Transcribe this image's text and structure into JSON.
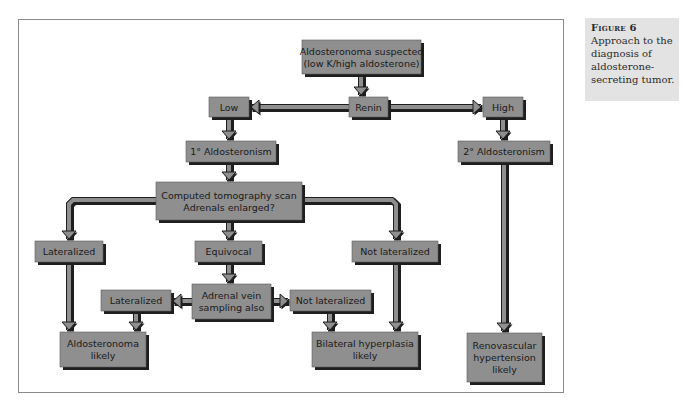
{
  "figure": {
    "label": "Figure 6",
    "caption": "Approach to the diagnosis of aldosterone-secreting tumor."
  },
  "colors": {
    "box_fill": "#8f8f8f",
    "box_shadow": "#1e1e1e",
    "arrow_fill": "#8f8f8f",
    "arrow_outline": "#1e1e1e",
    "frame_border": "#8a8a8a",
    "caption_bg": "#e3e3e3"
  },
  "nodes": {
    "start": {
      "lines": [
        "Aldosteronoma suspected",
        "(low K/high aldosterone)"
      ]
    },
    "renin": {
      "lines": [
        "Renin"
      ]
    },
    "low": {
      "lines": [
        "Low"
      ]
    },
    "high": {
      "lines": [
        "High"
      ]
    },
    "primary": {
      "lines": [
        "1° Aldosteronism"
      ]
    },
    "secondary": {
      "lines": [
        "2° Aldosteronism"
      ]
    },
    "ct_scan": {
      "lines": [
        "Computed tomography scan",
        "Adrenals enlarged?"
      ]
    },
    "ct_lateralized": {
      "lines": [
        "Lateralized"
      ]
    },
    "ct_equivocal": {
      "lines": [
        "Equivocal"
      ]
    },
    "ct_not_lateralized": {
      "lines": [
        "Not lateralized"
      ]
    },
    "avs": {
      "lines": [
        "Adrenal vein",
        "sampling also"
      ]
    },
    "avs_lateralized": {
      "lines": [
        "Lateralized"
      ]
    },
    "avs_not_lateralized": {
      "lines": [
        "Not lateralized"
      ]
    },
    "aldosteronoma": {
      "lines": [
        "Aldosteronoma",
        "likely"
      ]
    },
    "bilateral": {
      "lines": [
        "Bilateral hyperplasia",
        "likely"
      ]
    },
    "renovascular": {
      "lines": [
        "Renovascular",
        "hypertension",
        "likely"
      ]
    }
  },
  "edges": [
    [
      "start",
      "renin"
    ],
    [
      "renin",
      "low"
    ],
    [
      "renin",
      "high"
    ],
    [
      "low",
      "primary"
    ],
    [
      "high",
      "secondary"
    ],
    [
      "primary",
      "ct_scan"
    ],
    [
      "ct_scan",
      "ct_lateralized"
    ],
    [
      "ct_scan",
      "ct_equivocal"
    ],
    [
      "ct_scan",
      "ct_not_lateralized"
    ],
    [
      "ct_equivocal",
      "avs"
    ],
    [
      "avs",
      "avs_lateralized"
    ],
    [
      "avs",
      "avs_not_lateralized"
    ],
    [
      "ct_lateralized",
      "aldosteronoma"
    ],
    [
      "avs_lateralized",
      "aldosteronoma"
    ],
    [
      "ct_not_lateralized",
      "bilateral"
    ],
    [
      "avs_not_lateralized",
      "bilateral"
    ],
    [
      "secondary",
      "renovascular"
    ]
  ]
}
